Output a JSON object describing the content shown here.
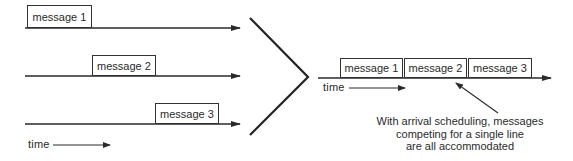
{
  "left_panel": {
    "timelines": [
      {
        "message_label": "message 1"
      },
      {
        "message_label": "message 2"
      },
      {
        "message_label": "message 3"
      }
    ],
    "time_axis_label": "time"
  },
  "right_panel": {
    "timeline_messages": [
      "message 1",
      "message 2",
      "message 3"
    ],
    "time_axis_label": "time",
    "caption_lines": [
      "With arrival scheduling, messages",
      "competing for a single line",
      "are all accommodated"
    ]
  },
  "colors": {
    "line": "#2a2a2a",
    "background": "#ffffff"
  }
}
